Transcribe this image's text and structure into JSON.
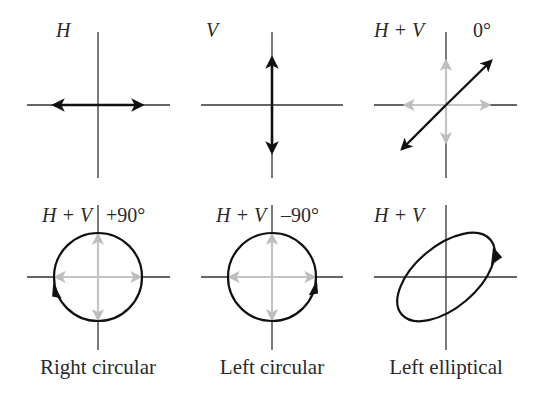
{
  "colors": {
    "axis": "#333333",
    "main_arrow": "#111111",
    "component_arrow": "#b8b8b8",
    "text": "#2a2a2a",
    "background": "#ffffff"
  },
  "panels": [
    {
      "id": "horizontal",
      "label": "H",
      "phase": "",
      "caption": "",
      "shape": "horizontal-linear-double-arrow"
    },
    {
      "id": "vertical",
      "label": "V",
      "phase": "",
      "caption": "",
      "shape": "vertical-linear-double-arrow"
    },
    {
      "id": "linear-45",
      "label": "H + V",
      "phase": "0°",
      "caption": "",
      "shape": "diagonal-linear-double-arrow",
      "components": [
        "H (grey)",
        "V (grey)"
      ]
    },
    {
      "id": "right-circular",
      "label": "H + V",
      "phase": "+90°",
      "caption": "Right circular",
      "shape": "circle",
      "rotation": "arrowhead at left side pointing up",
      "components": [
        "H (grey)",
        "V (grey)"
      ]
    },
    {
      "id": "left-circular",
      "label": "H + V",
      "phase": "–90°",
      "caption": "Left circular",
      "shape": "circle",
      "rotation": "arrowhead at right side pointing up",
      "components": [
        "H (grey)",
        "V (grey)"
      ]
    },
    {
      "id": "left-elliptical",
      "label": "H + V",
      "phase": "",
      "caption": "Left elliptical",
      "shape": "tilted-ellipse",
      "rotation": "arrowhead at upper right"
    }
  ]
}
